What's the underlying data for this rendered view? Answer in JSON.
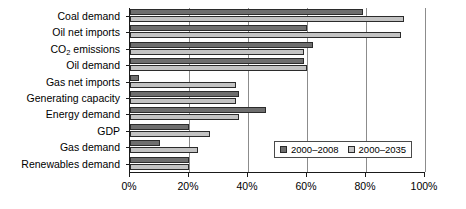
{
  "chart_data": {
    "type": "bar",
    "orientation": "horizontal",
    "title": "",
    "xlabel": "",
    "ylabel": "",
    "xlim": [
      0,
      100
    ],
    "xunit": "%",
    "grid": true,
    "legend_position": "inside-bottom-right",
    "xticks": [
      0,
      20,
      40,
      60,
      80,
      100
    ],
    "xticklabels": [
      "0%",
      "20%",
      "40%",
      "60%",
      "80%",
      "100%"
    ],
    "categories": [
      "Coal demand",
      "Oil net imports",
      "CO2 emissions",
      "Oil demand",
      "Gas net imports",
      "Generating capacity",
      "Energy demand",
      "GDP",
      "Gas demand",
      "Renewables demand"
    ],
    "category_labels_html": [
      "Coal demand",
      "Oil net imports",
      "CO<sub>2</sub> emissions",
      "Oil demand",
      "Gas net imports",
      "Generating capacity",
      "Energy demand",
      "GDP",
      "Gas demand",
      "Renewables demand"
    ],
    "series": [
      {
        "name": "2000–2008",
        "color": "#6e6e6e",
        "values": [
          79,
          60,
          62,
          59,
          3,
          37,
          46,
          20,
          10,
          20
        ]
      },
      {
        "name": "2000–2035",
        "color": "#c3c3c3",
        "values": [
          93,
          92,
          59,
          60,
          36,
          36,
          37,
          27,
          23,
          20
        ]
      }
    ]
  },
  "legend": {
    "entries": [
      {
        "label": "2000–2008",
        "swatch": "recent"
      },
      {
        "label": "2000–2035",
        "swatch": "future"
      }
    ]
  }
}
